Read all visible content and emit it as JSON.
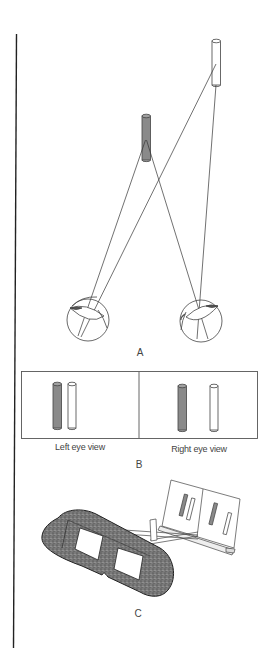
{
  "figure": {
    "panels": [
      {
        "id": "A",
        "label": "A",
        "description": "Two eyes converging on a near grey rod and a far white rod"
      },
      {
        "id": "B",
        "label": "B",
        "views": [
          {
            "label": "Left eye view"
          },
          {
            "label": "Right eye view"
          }
        ]
      },
      {
        "id": "C",
        "label": "C",
        "description": "Stereoscope viewer with card holding two stereo image pairs"
      }
    ],
    "colors": {
      "line": "#333333",
      "near_rod": "#8a8a8a",
      "far_rod": "#ffffff",
      "viewer_body": "#6e6e6e",
      "background": "#ffffff"
    }
  }
}
